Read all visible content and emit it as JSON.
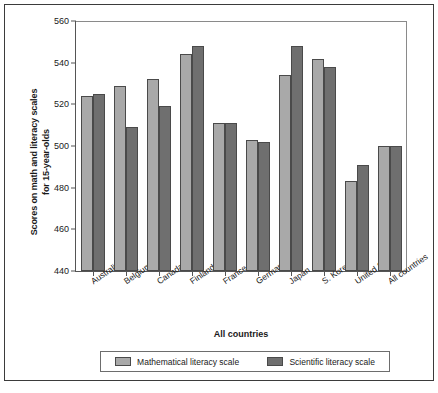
{
  "chart_data": {
    "type": "bar",
    "title": "",
    "xlabel": "All countries",
    "ylabel": "Scores on math and literacy scales for 15-year-olds",
    "ylabel_line1": "Scores on math and literacy scales",
    "ylabel_line2": "for 15-year-olds",
    "ylim": [
      440,
      560
    ],
    "yticks": [
      440,
      460,
      480,
      500,
      520,
      540,
      560
    ],
    "grid": false,
    "legend_position": "bottom",
    "categories": [
      "Australia",
      "Belgium",
      "Canada",
      "Finland",
      "France",
      "Germany",
      "Japan",
      "S. Korea",
      "United States",
      "All countries"
    ],
    "series": [
      {
        "name": "Mathematical literacy scale",
        "color": "#a9a9a9",
        "values": [
          524,
          529,
          532,
          544,
          511,
          503,
          534,
          542,
          483,
          500
        ]
      },
      {
        "name": "Scientific literacy scale",
        "color": "#6f6f6f",
        "values": [
          525,
          509,
          519,
          548,
          511,
          502,
          548,
          538,
          491,
          500
        ]
      }
    ]
  }
}
